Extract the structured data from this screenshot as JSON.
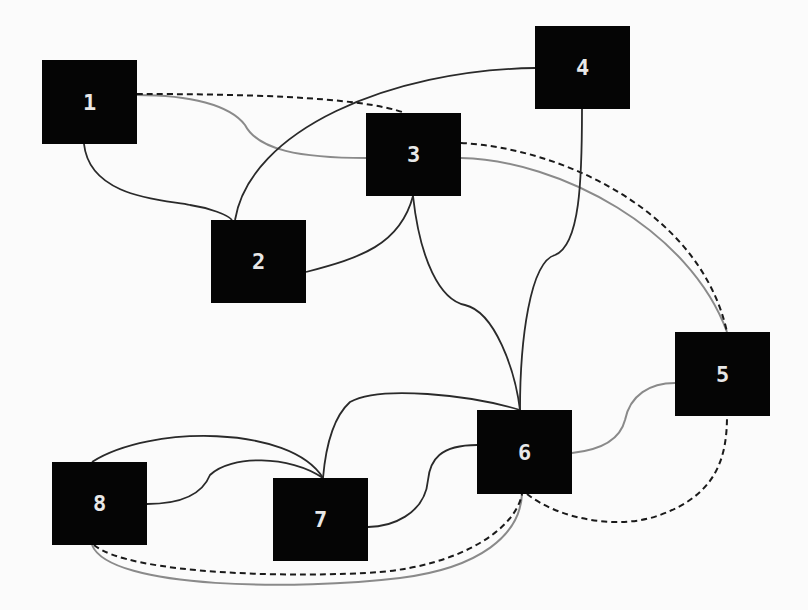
{
  "diagram": {
    "type": "graph",
    "background": "#fbfbfb",
    "colors": {
      "node_fill": "#050505",
      "node_text": "#e8e8e8",
      "edge_dark": "#2a2a2a",
      "edge_gray": "#8a8a8a",
      "edge_dashed": "#1a1a1a"
    },
    "nodes": [
      {
        "id": "1",
        "label": "1",
        "x": 42,
        "y": 60,
        "w": 95,
        "h": 84
      },
      {
        "id": "2",
        "label": "2",
        "x": 211,
        "y": 220,
        "w": 95,
        "h": 83
      },
      {
        "id": "3",
        "label": "3",
        "x": 366,
        "y": 113,
        "w": 95,
        "h": 83
      },
      {
        "id": "4",
        "label": "4",
        "x": 535,
        "y": 26,
        "w": 95,
        "h": 83
      },
      {
        "id": "5",
        "label": "5",
        "x": 675,
        "y": 332,
        "w": 95,
        "h": 84
      },
      {
        "id": "6",
        "label": "6",
        "x": 477,
        "y": 410,
        "w": 95,
        "h": 84
      },
      {
        "id": "7",
        "label": "7",
        "x": 273,
        "y": 478,
        "w": 95,
        "h": 83
      },
      {
        "id": "8",
        "label": "8",
        "x": 52,
        "y": 462,
        "w": 95,
        "h": 83
      }
    ],
    "edges": [
      {
        "from": "1",
        "to": "2",
        "style": "solid-dark",
        "d": "M84,144 C90,200 170,200 190,205 C210,208 228,215 232,220"
      },
      {
        "from": "1",
        "to": "3",
        "style": "solid-gray",
        "d": "M137,95 C190,95 230,105 245,125 C258,150 300,158 366,158"
      },
      {
        "from": "1",
        "to": "3",
        "style": "dashed",
        "d": "M137,94 C230,94 360,96 405,113"
      },
      {
        "from": "2",
        "to": "4",
        "style": "solid-dark",
        "d": "M235,220 C250,130 390,70 535,68"
      },
      {
        "from": "2",
        "to": "3",
        "style": "solid-dark",
        "d": "M306,272 C360,258 400,245 413,196"
      },
      {
        "from": "3",
        "to": "6",
        "style": "solid-dark",
        "d": "M413,196 C420,260 440,300 465,305 C495,312 515,370 520,410"
      },
      {
        "from": "3",
        "to": "5",
        "style": "solid-gray",
        "d": "M461,158 C560,160 690,230 727,332"
      },
      {
        "from": "3",
        "to": "5",
        "style": "dashed",
        "d": "M461,143 C560,148 700,210 727,332"
      },
      {
        "from": "4",
        "to": "6",
        "style": "solid-dark",
        "d": "M582,109 C582,180 580,245 555,255 C530,262 520,340 520,410"
      },
      {
        "from": "6",
        "to": "7",
        "style": "solid-dark",
        "d": "M520,410 C470,395 380,385 350,402 C330,420 325,455 323,478"
      },
      {
        "from": "6",
        "to": "7",
        "style": "solid-dark",
        "d": "M477,445 C440,445 430,460 428,480 C425,515 390,527 368,527"
      },
      {
        "from": "6",
        "to": "5",
        "style": "solid-gray",
        "d": "M572,453 C600,450 620,440 625,420 C630,395 650,383 675,383"
      },
      {
        "from": "6",
        "to": "5",
        "style": "dashed",
        "d": "M527,494 C560,520 620,530 660,515 C715,495 727,460 727,416"
      },
      {
        "from": "7",
        "to": "8",
        "style": "solid-dark",
        "d": "M323,478 C290,425 150,425 92,462"
      },
      {
        "from": "7",
        "to": "8",
        "style": "solid-dark",
        "d": "M323,478 C290,455 230,455 210,475 C200,500 170,504 147,504"
      },
      {
        "from": "8",
        "to": "6",
        "style": "solid-gray",
        "d": "M92,545 C110,590 300,590 400,578 C480,568 520,535 522,494"
      },
      {
        "from": "8",
        "to": "6",
        "style": "dashed",
        "d": "M94,545 C130,575 300,578 380,572 C460,565 515,530 522,494"
      }
    ]
  }
}
